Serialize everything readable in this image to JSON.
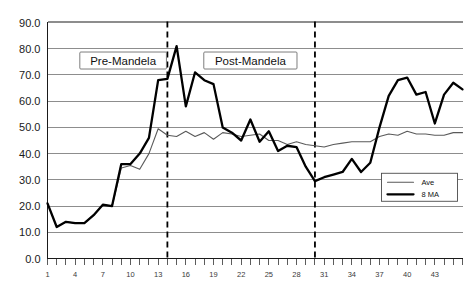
{
  "chart_data": {
    "type": "line",
    "title": "",
    "subtitle": "",
    "xlabel": "",
    "ylabel": "",
    "xlim": [
      1,
      46
    ],
    "ylim": [
      0,
      90
    ],
    "ytick_step": 10,
    "grid": true,
    "legend_position": "bottom-right",
    "ytick_labels": [
      "0.0",
      "10.0",
      "20.0",
      "30.0",
      "40.0",
      "50.0",
      "60.0",
      "70.0",
      "80.0",
      "90.0"
    ],
    "ytick_values": [
      0,
      10,
      20,
      30,
      40,
      50,
      60,
      70,
      80,
      90
    ],
    "xtick_labels": [
      "1",
      "4",
      "7",
      "10",
      "13",
      "16",
      "19",
      "22",
      "25",
      "28",
      "31",
      "34",
      "37",
      "40",
      "43"
    ],
    "xtick_values": [
      1,
      4,
      7,
      10,
      13,
      16,
      19,
      22,
      25,
      28,
      31,
      34,
      37,
      40,
      43
    ],
    "x": [
      1,
      2,
      3,
      4,
      5,
      6,
      7,
      8,
      9,
      10,
      11,
      12,
      13,
      14,
      15,
      16,
      17,
      18,
      19,
      20,
      21,
      22,
      23,
      24,
      25,
      26,
      27,
      28,
      29,
      30,
      31,
      32,
      33,
      34,
      35,
      36,
      37,
      38,
      39,
      40,
      41,
      42,
      43,
      44,
      45,
      46
    ],
    "series": [
      {
        "name": "Ave",
        "style": "thin",
        "color": "#5a5a5a",
        "values": [
          21.0,
          12.0,
          14.0,
          13.5,
          13.5,
          16.5,
          20.5,
          20.0,
          34.5,
          35.5,
          34.0,
          40.0,
          49.5,
          47.0,
          46.5,
          48.5,
          46.5,
          48.0,
          45.5,
          48.0,
          47.5,
          46.5,
          47.0,
          47.5,
          45.0,
          45.0,
          43.5,
          44.5,
          43.5,
          43.0,
          42.5,
          43.5,
          44.0,
          44.5,
          44.5,
          44.5,
          46.5,
          47.5,
          47.0,
          48.5,
          47.5,
          47.5,
          47.0,
          47.0,
          48.0,
          48.0
        ]
      },
      {
        "name": "8 MA",
        "style": "thick",
        "color": "#000000",
        "values": [
          21.0,
          12.0,
          14.0,
          13.5,
          13.5,
          16.5,
          20.5,
          20.0,
          36.0,
          36.0,
          40.0,
          46.0,
          68.0,
          68.5,
          81.0,
          58.0,
          71.0,
          68.0,
          66.5,
          50.0,
          48.0,
          45.0,
          53.0,
          44.5,
          48.5,
          41.0,
          43.0,
          42.5,
          35.0,
          29.5,
          31.0,
          32.0,
          33.0,
          38.0,
          33.0,
          36.5,
          50.0,
          62.0,
          68.0,
          69.0,
          62.5,
          63.5,
          51.5,
          62.5,
          67.0,
          64.5
        ]
      }
    ],
    "annotations": [
      {
        "label": "Pre-Mandela",
        "type": "boxed-label",
        "x_center": 9.2
      },
      {
        "label": "Post-Mandela",
        "type": "boxed-label",
        "x_center": 23.0
      }
    ],
    "dividers": [
      {
        "x": 14,
        "style": "dashed"
      },
      {
        "x": 30,
        "style": "dashed"
      }
    ],
    "legend": [
      {
        "label": "Ave",
        "style": "thin"
      },
      {
        "label": "8 MA",
        "style": "thick"
      }
    ]
  }
}
